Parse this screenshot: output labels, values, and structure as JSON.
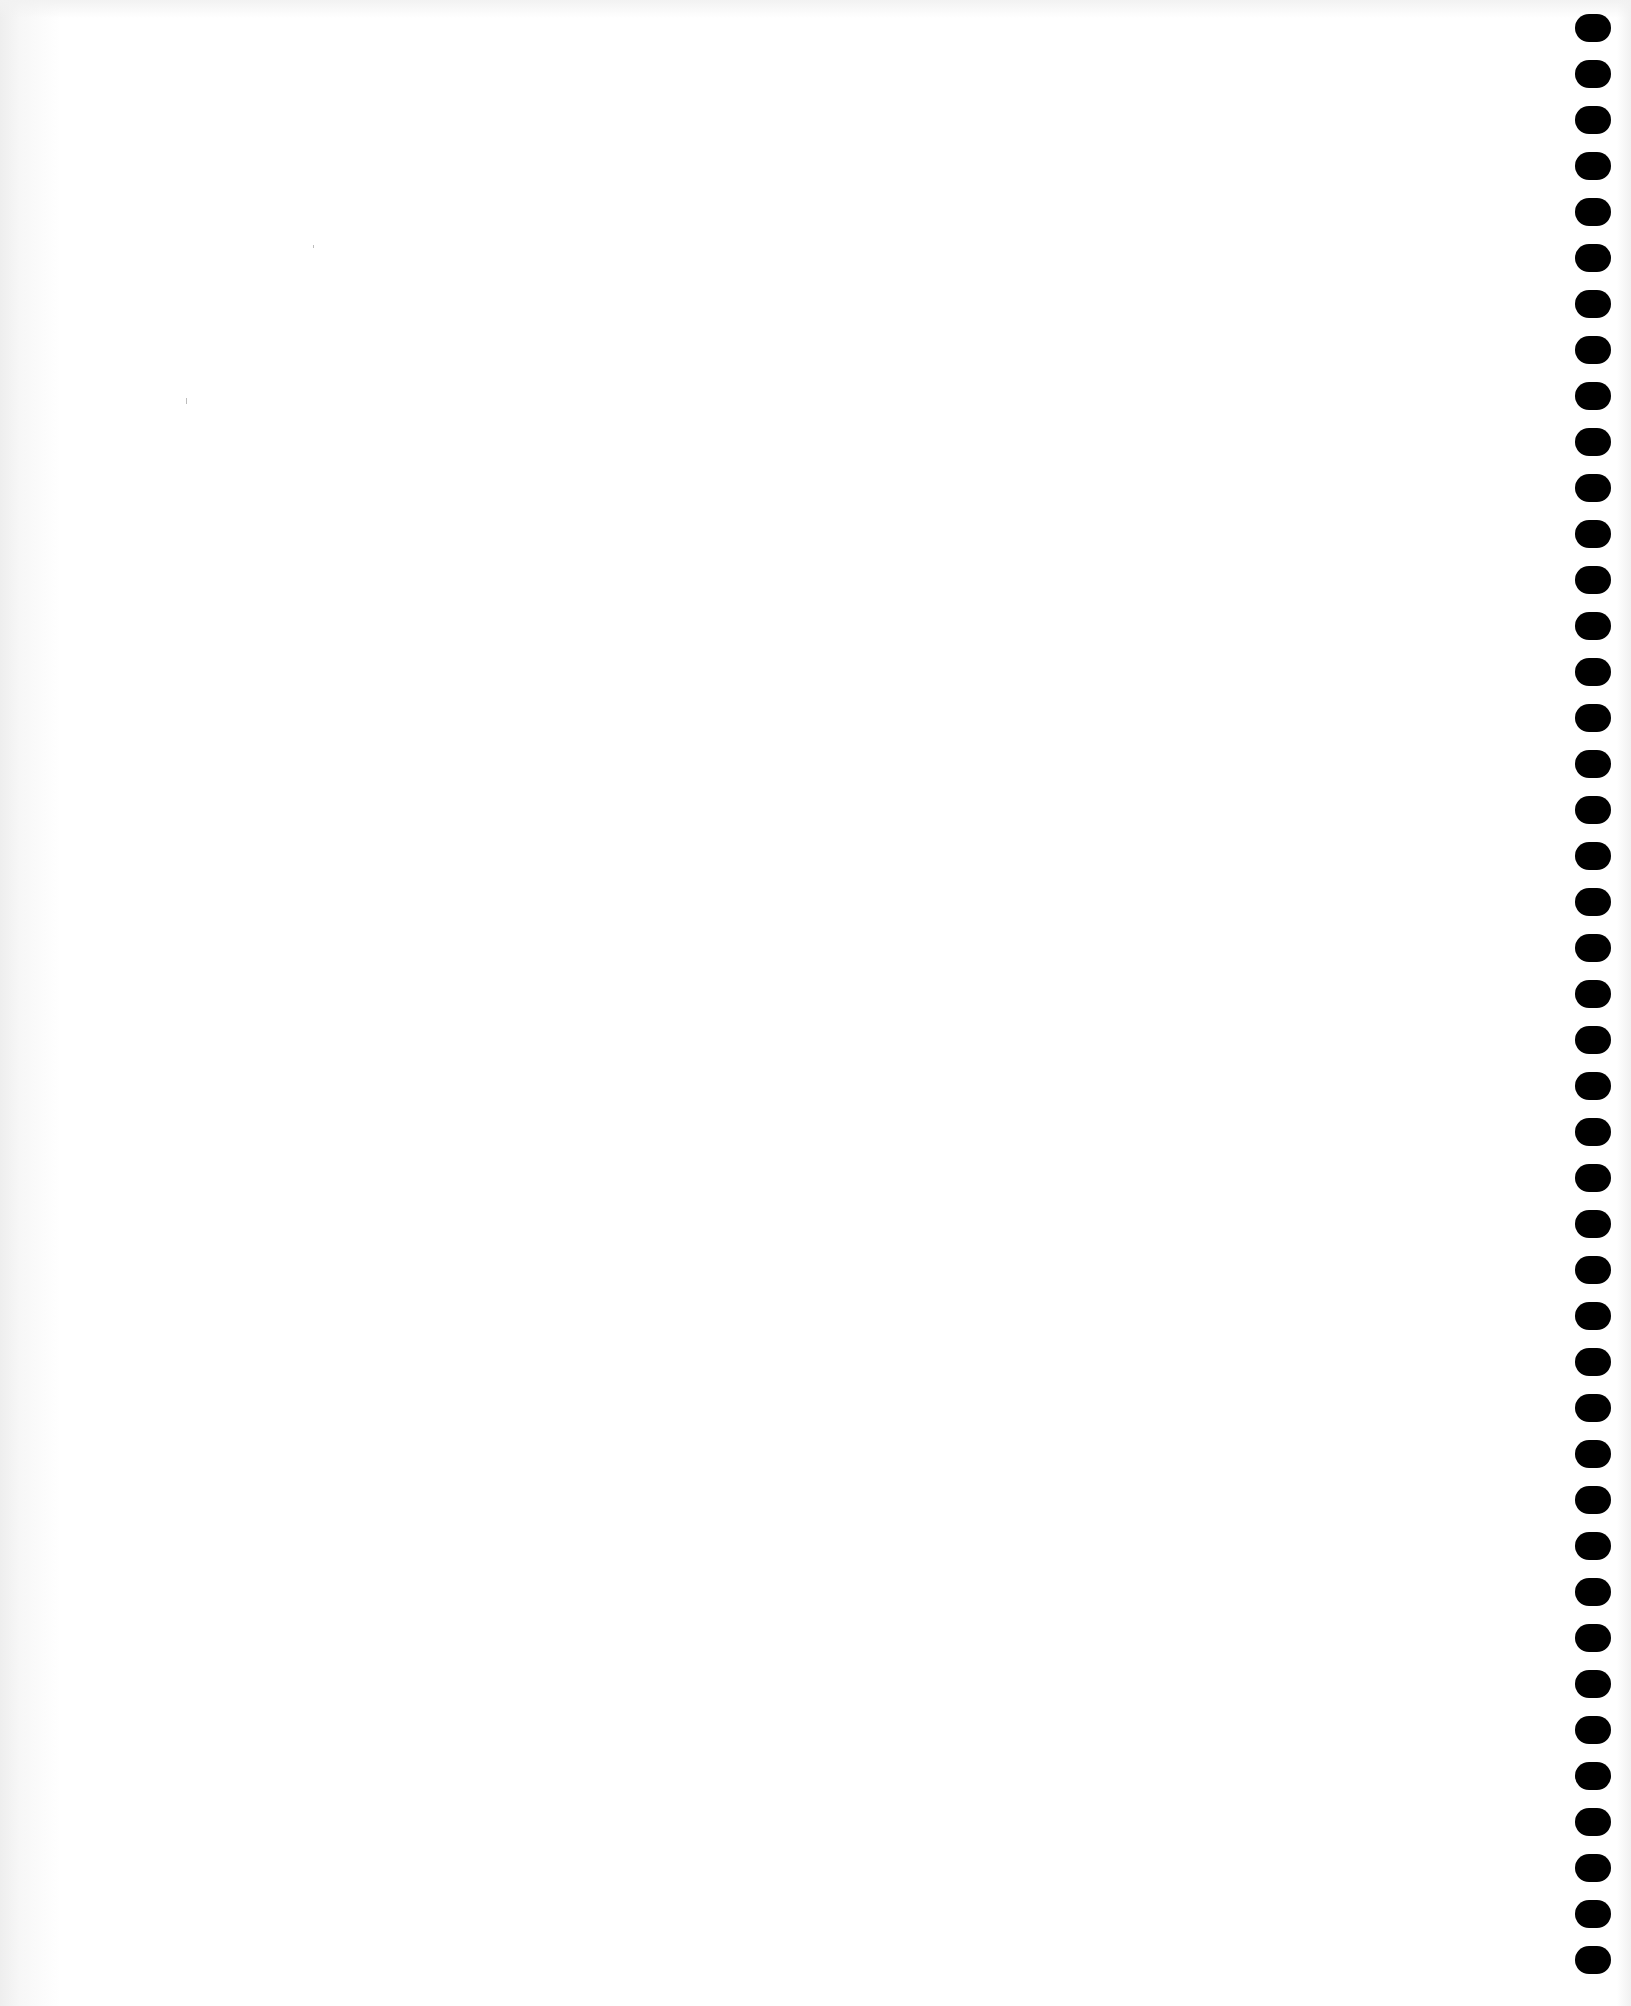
{
  "page": {
    "type": "blank scanned notebook page",
    "background_color": "#ffffff",
    "text": ""
  },
  "binding": {
    "side": "right",
    "hole_count": 43,
    "hole_color": "#000000",
    "first_hole_top": 14,
    "hole_spacing": 46
  }
}
